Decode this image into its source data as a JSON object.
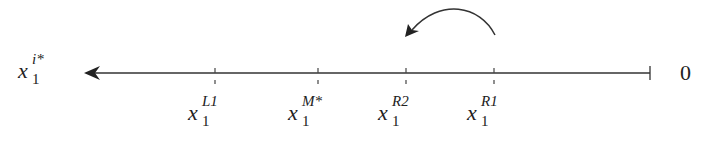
{
  "diagram": {
    "axis": {
      "left_label": {
        "base": "x",
        "sup": "i*",
        "sub": "1"
      },
      "right_label": "0"
    },
    "ticks": [
      {
        "base": "x",
        "sup": "L1",
        "sub": "1",
        "x": 215
      },
      {
        "base": "x",
        "sup": "M*",
        "sub": "1",
        "x": 318
      },
      {
        "base": "x",
        "sup": "R2",
        "sub": "1",
        "x": 406
      },
      {
        "base": "x",
        "sup": "R1",
        "sub": "1",
        "x": 494
      }
    ],
    "curved_arrow": {
      "from": "R1",
      "to": "R2"
    }
  }
}
